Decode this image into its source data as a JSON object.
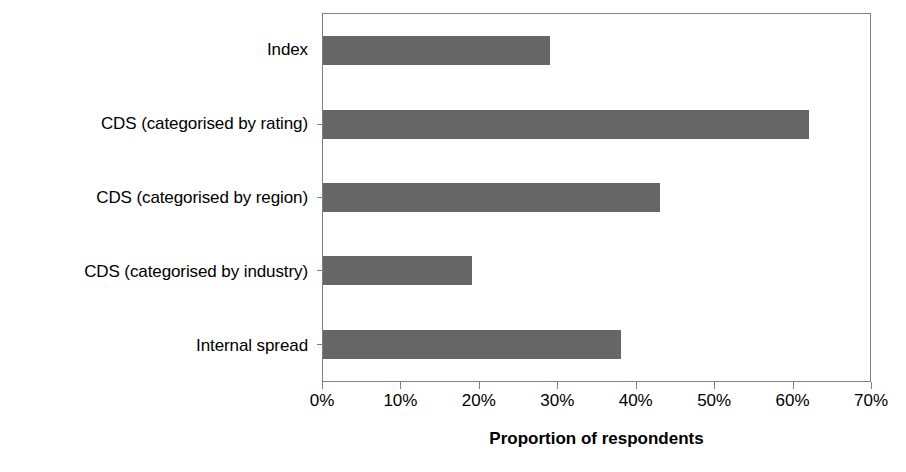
{
  "chart_data": {
    "type": "bar",
    "orientation": "horizontal",
    "title": "",
    "subtitle": "",
    "xlabel": "Proportion of respondents",
    "ylabel": "",
    "categories": [
      "Index",
      "CDS (categorised by rating)",
      "CDS (categorised by region)",
      "CDS (categorised by industry)",
      "Internal spread"
    ],
    "values": [
      29,
      62,
      43,
      19,
      38
    ],
    "value_suffix": "%",
    "xlim": [
      0,
      70
    ],
    "xticks": [
      0,
      10,
      20,
      30,
      40,
      50,
      60,
      70
    ],
    "xticklabels": [
      "0%",
      "10%",
      "20%",
      "30%",
      "40%",
      "50%",
      "60%",
      "70%"
    ],
    "grid": false,
    "legend": null,
    "series": [
      {
        "name": "Proportion of respondents",
        "values": [
          29,
          62,
          43,
          19,
          38
        ]
      }
    ],
    "colors": {
      "bar": "#666666",
      "axis": "#808080",
      "text": "#000000",
      "background": "#ffffff"
    }
  }
}
